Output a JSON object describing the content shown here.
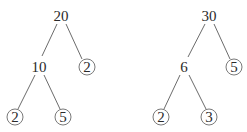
{
  "diagram": {
    "type": "tree-pair",
    "trees": [
      {
        "name": "left-tree",
        "nodes": [
          {
            "id": "n20",
            "label": "20",
            "x": 61,
            "y": 16,
            "leaf": false
          },
          {
            "id": "n10",
            "label": "10",
            "x": 39,
            "y": 67,
            "leaf": false
          },
          {
            "id": "n2a",
            "label": "2",
            "x": 87,
            "y": 67,
            "leaf": true
          },
          {
            "id": "n2b",
            "label": "2",
            "x": 15,
            "y": 117,
            "leaf": true
          },
          {
            "id": "n5",
            "label": "5",
            "x": 63,
            "y": 117,
            "leaf": true
          }
        ],
        "edges": [
          {
            "from": "n20",
            "to": "n10"
          },
          {
            "from": "n20",
            "to": "n2a"
          },
          {
            "from": "n10",
            "to": "n2b"
          },
          {
            "from": "n10",
            "to": "n5"
          }
        ]
      },
      {
        "name": "right-tree",
        "nodes": [
          {
            "id": "m30",
            "label": "30",
            "x": 209,
            "y": 16,
            "leaf": false
          },
          {
            "id": "m6",
            "label": "6",
            "x": 184,
            "y": 67,
            "leaf": false
          },
          {
            "id": "m5",
            "label": "5",
            "x": 234,
            "y": 67,
            "leaf": true
          },
          {
            "id": "m2",
            "label": "2",
            "x": 161,
            "y": 117,
            "leaf": true
          },
          {
            "id": "m3",
            "label": "3",
            "x": 209,
            "y": 117,
            "leaf": true
          }
        ],
        "edges": [
          {
            "from": "m30",
            "to": "m6"
          },
          {
            "from": "m30",
            "to": "m5"
          },
          {
            "from": "m6",
            "to": "m2"
          },
          {
            "from": "m6",
            "to": "m3"
          }
        ]
      }
    ],
    "colors": {
      "text": "#2a2a2a",
      "edge": "#5a5a5a",
      "circle": "#6a6a6a",
      "background": "#ffffff"
    }
  }
}
